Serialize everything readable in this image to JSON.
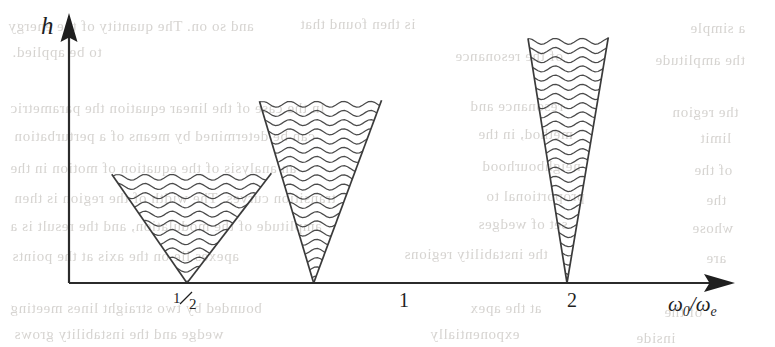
{
  "figure": {
    "title": "",
    "axes": {
      "y_label": "h",
      "x_label": "ω₀/ωₑ",
      "x_label_main": "ω",
      "x_label_sub1": "0",
      "x_label_slash": "/",
      "x_label_main2": "ω",
      "x_label_sub2": "e",
      "origin_label": "",
      "tick_labels": [
        "½",
        "1",
        "2"
      ],
      "tick_half_numerator": "1",
      "tick_half_denominator": "2",
      "axis_color": "#2b2b2b",
      "arrow_style": "solid-filled"
    },
    "wedges": [
      {
        "name": "wedge-half",
        "tick": "½",
        "apex_x": 0.5,
        "height": 0.42,
        "half_width_at_top": 0.82,
        "aperture": "wide",
        "fill": "wavy-lines"
      },
      {
        "name": "wedge-one",
        "tick": "1",
        "apex_x": 1.0,
        "height": 0.7,
        "half_width_at_top": 0.56,
        "aperture": "medium",
        "fill": "wavy-lines"
      },
      {
        "name": "wedge-two",
        "tick": "2",
        "apex_x": 2.0,
        "height": 0.94,
        "half_width_at_top": 0.45,
        "aperture": "narrow",
        "fill": "wavy-lines"
      }
    ],
    "line_color": "#3a3a3a",
    "wave_color": "#4a4a4a"
  },
  "chart_data": {
    "type": "line",
    "title": "",
    "xlabel": "ω₀/ωₑ",
    "ylabel": "h",
    "xlim": [
      0,
      2.45
    ],
    "ylim": [
      0,
      1.0
    ],
    "grid": false,
    "legend": "none",
    "xtick_values": [
      0.5,
      1,
      2
    ],
    "xtick_labels": [
      "½",
      "1",
      "2"
    ],
    "ytick_values": [],
    "ytick_labels": [],
    "annotations": [
      "Three wedge-shaped (V) instability tongues with wavy-line hatching, apexes on the horizontal axis at ω₀/ωₑ = ½, 1 and 2.",
      "Tongue width decreases and tongue height increases as ω₀/ωₑ increases."
    ],
    "series": [
      {
        "name": "wedge at 1/2 - left boundary",
        "x": [
          0.5,
          0.203
        ],
        "y": [
          0.0,
          0.418
        ]
      },
      {
        "name": "wedge at 1/2 - right boundary",
        "x": [
          0.5,
          0.833
        ],
        "y": [
          0.0,
          0.422
        ]
      },
      {
        "name": "wedge at 1 - left boundary",
        "x": [
          1.0,
          0.786
        ],
        "y": [
          0.0,
          0.699
        ]
      },
      {
        "name": "wedge at 1 - right boundary",
        "x": [
          1.0,
          1.268
        ],
        "y": [
          0.0,
          0.703
        ]
      },
      {
        "name": "wedge at 2 - left boundary",
        "x": [
          2.0,
          1.846
        ],
        "y": [
          0.0,
          0.941
        ]
      },
      {
        "name": "wedge at 2 - right boundary",
        "x": [
          2.0,
          2.163
        ],
        "y": [
          0.0,
          0.945
        ]
      }
    ]
  },
  "background_ghost_text": {
    "note": "faint mirrored show-through from the reverse of the scanned page",
    "lines": [
      {
        "text": "and so on. The quantity of the energy",
        "x": 8,
        "y": 18
      },
      {
        "text": "is then found that",
        "x": 300,
        "y": 16
      },
      {
        "text": "a simple",
        "x": 690,
        "y": 20
      },
      {
        "text": "to be applied.",
        "x": 12,
        "y": 44
      },
      {
        "text": "of the resonance",
        "x": 455,
        "y": 48
      },
      {
        "text": "the amplitude",
        "x": 655,
        "y": 52
      },
      {
        "text": "In the case of the linear equation the parametric",
        "x": 10,
        "y": 100
      },
      {
        "text": "resonance and",
        "x": 470,
        "y": 98
      },
      {
        "text": "the region",
        "x": 672,
        "y": 104
      },
      {
        "text": "can be determined by means of a perturbation",
        "x": 14,
        "y": 128
      },
      {
        "text": "method, in the",
        "x": 478,
        "y": 126
      },
      {
        "text": "limit",
        "x": 700,
        "y": 130
      },
      {
        "text": "an analysis of the equation of motion in the",
        "x": 10,
        "y": 160
      },
      {
        "text": "neighbourhood",
        "x": 482,
        "y": 158
      },
      {
        "text": "of the",
        "x": 694,
        "y": 162
      },
      {
        "text": "transition curves. The width of the region is then",
        "x": 14,
        "y": 190
      },
      {
        "text": "proportional to",
        "x": 486,
        "y": 188
      },
      {
        "text": "the",
        "x": 706,
        "y": 192
      },
      {
        "text": "amplitude of the modulation, and the result is a",
        "x": 10,
        "y": 218
      },
      {
        "text": "set of wedges",
        "x": 478,
        "y": 216
      },
      {
        "text": "whose",
        "x": 692,
        "y": 220
      },
      {
        "text": "apexes lie on the axis at the points",
        "x": 12,
        "y": 248
      },
      {
        "text": "the instability regions",
        "x": 404,
        "y": 246
      },
      {
        "text": "are",
        "x": 706,
        "y": 250
      },
      {
        "text": "bounded by two straight lines meeting",
        "x": 10,
        "y": 300
      },
      {
        "text": "at the apex",
        "x": 470,
        "y": 300
      },
      {
        "text": "of the",
        "x": 664,
        "y": 304
      },
      {
        "text": "wedge and the instability grows",
        "x": 14,
        "y": 326
      },
      {
        "text": "exponentially",
        "x": 430,
        "y": 326
      },
      {
        "text": "inside",
        "x": 636,
        "y": 330
      }
    ]
  }
}
